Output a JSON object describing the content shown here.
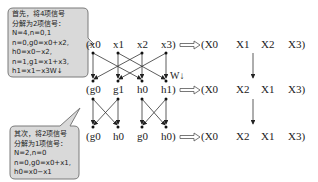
{
  "callouts": [
    {
      "lines": [
        "首先，将4项信号",
        "分解为2项信号：",
        "N=4,n=0,1",
        "n=0,g0=x0+x2,",
        "    h0=x0−x2,",
        "n=1,g1=x1+x3,",
        "    h1=x1−x3W↓"
      ]
    },
    {
      "lines": [
        "其次，将2项信号",
        "分解为1项信号：",
        "N=2,n=0",
        "n=0,g0=x0+x1,",
        "    h0=x0−x1"
      ]
    }
  ],
  "rows": [
    {
      "left": [
        "(x0",
        "x1",
        "x2",
        "x3)"
      ],
      "right": [
        "(X0",
        "X1",
        "X2",
        "X3)"
      ]
    },
    {
      "left": [
        "(g0",
        "g1",
        "h0",
        "h1)"
      ],
      "right": [
        "(X0",
        "X2",
        "X1",
        "X3)"
      ]
    },
    {
      "left": [
        "(g0",
        "h0",
        "g0",
        "h0)"
      ],
      "right": [
        "(X0",
        "X2",
        "X1",
        "X3)"
      ]
    }
  ],
  "twiddle_label": "W↓",
  "colors": {
    "bubble_fill": "#d9d9d9",
    "bubble_stroke": "#7a7a7a",
    "line": "#333333"
  }
}
